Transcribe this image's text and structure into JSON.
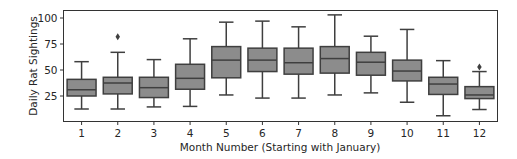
{
  "chart_data": {
    "type": "box",
    "title": "",
    "xlabel": "Month Number (Starting with January)",
    "ylabel": "Daily Rat Sightings",
    "ylim": [
      1,
      107
    ],
    "yticks": [
      25,
      50,
      75,
      100
    ],
    "grid": false,
    "legend": null,
    "categories": [
      "1",
      "2",
      "3",
      "4",
      "5",
      "6",
      "7",
      "8",
      "9",
      "10",
      "11",
      "12"
    ],
    "boxes": [
      {
        "month": "1",
        "whisker_low": 12.5,
        "q1": 25,
        "median": 31,
        "q3": 41,
        "whisker_high": 58,
        "outliers": []
      },
      {
        "month": "2",
        "whisker_low": 12.5,
        "q1": 27,
        "median": 37.5,
        "q3": 43,
        "whisker_high": 67,
        "outliers": [
          82
        ]
      },
      {
        "month": "3",
        "whisker_low": 14.5,
        "q1": 23.5,
        "median": 33,
        "q3": 43,
        "whisker_high": 60,
        "outliers": []
      },
      {
        "month": "4",
        "whisker_low": 15,
        "q1": 31.5,
        "median": 42,
        "q3": 55.5,
        "whisker_high": 80,
        "outliers": []
      },
      {
        "month": "5",
        "whisker_low": 26,
        "q1": 42.5,
        "median": 59.5,
        "q3": 72.5,
        "whisker_high": 96,
        "outliers": []
      },
      {
        "month": "6",
        "whisker_low": 23,
        "q1": 48.5,
        "median": 59.5,
        "q3": 71,
        "whisker_high": 97,
        "outliers": []
      },
      {
        "month": "7",
        "whisker_low": 23,
        "q1": 46,
        "median": 57,
        "q3": 71,
        "whisker_high": 91.5,
        "outliers": []
      },
      {
        "month": "8",
        "whisker_low": 26,
        "q1": 47,
        "median": 61,
        "q3": 72.5,
        "whisker_high": 103,
        "outliers": []
      },
      {
        "month": "9",
        "whisker_low": 28,
        "q1": 45,
        "median": 57.5,
        "q3": 67,
        "whisker_high": 82.5,
        "outliers": []
      },
      {
        "month": "10",
        "whisker_low": 19,
        "q1": 39.5,
        "median": 49,
        "q3": 59.5,
        "whisker_high": 89,
        "outliers": []
      },
      {
        "month": "11",
        "whisker_low": 6,
        "q1": 26.5,
        "median": 36.5,
        "q3": 43,
        "whisker_high": 59,
        "outliers": []
      },
      {
        "month": "12",
        "whisker_low": 12,
        "q1": 22.5,
        "median": 26,
        "q3": 34,
        "whisker_high": 48.5,
        "outliers": [
          53
        ]
      }
    ],
    "colors": {
      "box_fill": "#8c8c8c",
      "line": "#3f3f3f",
      "frame": "#333333",
      "text": "#262626"
    }
  }
}
